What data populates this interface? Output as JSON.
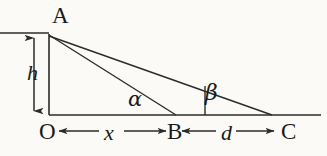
{
  "figure": {
    "background_color": "#fbfaf7",
    "stroke_color": "#2b2b2b",
    "points": {
      "A": "A",
      "O": "O",
      "B": "B",
      "C": "C"
    },
    "measures": {
      "height": "h",
      "distance_ob": "x",
      "distance_bc": "d"
    },
    "angles": {
      "at_B": "α",
      "at_C": "β"
    },
    "geometry": {
      "A": [
        49,
        34
      ],
      "O": [
        49,
        115
      ],
      "B": [
        175,
        115
      ],
      "C": [
        272,
        115
      ],
      "baseline_start": [
        49,
        115
      ],
      "baseline_end": [
        321,
        115
      ],
      "top_line_start": [
        0,
        33
      ],
      "top_line_end": [
        49,
        33
      ],
      "beta_tick_x": 205,
      "h_arrow_x": 34,
      "h_arrow_top": 36,
      "h_arrow_bottom": 113,
      "x_dim_y": 131,
      "d_dim_y": 131
    }
  }
}
